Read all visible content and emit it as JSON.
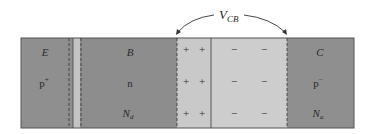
{
  "diagram": {
    "voltage_label": {
      "main": "V",
      "sub": "CB"
    },
    "colors": {
      "neutral_region": "#8f8f8f",
      "depletion_region": "#c9c9c9",
      "emitter_strip": "#c4c4c4",
      "outline": "#555555",
      "text": "#2a2a2a"
    },
    "regions": [
      {
        "id": "emitter",
        "name": "E",
        "type": "p",
        "type_sup": "+",
        "doping": ""
      },
      {
        "id": "base",
        "name": "B",
        "type": "n",
        "type_sup": "",
        "doping": "N",
        "doping_sub": "d"
      },
      {
        "id": "collector",
        "name": "C",
        "type": "p",
        "type_sup": "−",
        "doping": "N",
        "doping_sub": "a"
      }
    ],
    "depletion": {
      "positive_side": {
        "charge": "+",
        "rows": 3,
        "cols": 2
      },
      "negative_side": {
        "charge": "−",
        "rows": 3,
        "cols": 2
      }
    }
  }
}
